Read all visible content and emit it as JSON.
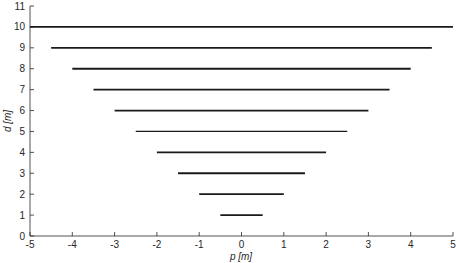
{
  "chart_data": {
    "type": "line",
    "title": "",
    "xlabel": "p [m]",
    "ylabel": "d [m]",
    "xlim": [
      -5,
      5
    ],
    "ylim": [
      0,
      11
    ],
    "xticks": [
      -5,
      -4,
      -3,
      -2,
      -1,
      0,
      1,
      2,
      3,
      4,
      5
    ],
    "yticks": [
      0,
      1,
      2,
      3,
      4,
      5,
      6,
      7,
      8,
      9,
      10,
      11
    ],
    "grid": false,
    "legend": null,
    "line_color": "#1a1a1a",
    "series": [
      {
        "name": "d=1",
        "x": [
          -0.5,
          0.5
        ],
        "y": [
          1,
          1
        ]
      },
      {
        "name": "d=2",
        "x": [
          -1.0,
          1.0
        ],
        "y": [
          2,
          2
        ]
      },
      {
        "name": "d=3",
        "x": [
          -1.5,
          1.5
        ],
        "y": [
          3,
          3
        ]
      },
      {
        "name": "d=4",
        "x": [
          -2.0,
          2.0
        ],
        "y": [
          4,
          4
        ]
      },
      {
        "name": "d=5",
        "x": [
          -2.5,
          2.5
        ],
        "y": [
          5,
          5
        ],
        "thin": true
      },
      {
        "name": "d=6",
        "x": [
          -3.0,
          3.0
        ],
        "y": [
          6,
          6
        ]
      },
      {
        "name": "d=7",
        "x": [
          -3.5,
          3.5
        ],
        "y": [
          7,
          7
        ]
      },
      {
        "name": "d=8",
        "x": [
          -4.0,
          4.0
        ],
        "y": [
          8,
          8
        ]
      },
      {
        "name": "d=9",
        "x": [
          -4.5,
          4.5
        ],
        "y": [
          9,
          9
        ]
      },
      {
        "name": "d=10",
        "x": [
          -5.0,
          5.0
        ],
        "y": [
          10,
          10
        ]
      }
    ]
  }
}
